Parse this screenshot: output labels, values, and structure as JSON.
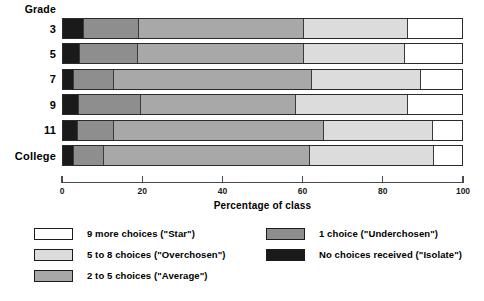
{
  "chart_data": {
    "type": "bar",
    "subtype": "stacked-horizontal-100",
    "title": "",
    "xlabel": "Percentage of class",
    "ylabel": "Grade",
    "xlim": [
      0,
      100
    ],
    "xticks": [
      0,
      20,
      40,
      60,
      80,
      100
    ],
    "xticklabels": [
      "0",
      "20",
      "40",
      "60",
      "80",
      "100"
    ],
    "grid": false,
    "legend_position": "bottom",
    "categories": [
      "3",
      "5",
      "7",
      "9",
      "11",
      "College"
    ],
    "series": [
      {
        "name": "No choices received (\"Isolate\")",
        "color": "#1a1a1a",
        "values": [
          5.2,
          4.3,
          2.7,
          4.1,
          3.8,
          2.8
        ]
      },
      {
        "name": "1 choice (\"Underchosen\")",
        "color": "#8e8e8e",
        "values": [
          13.8,
          14.4,
          10.1,
          15.4,
          8.9,
          7.5
        ]
      },
      {
        "name": "2 to 5 choices (\"Average\")",
        "color": "#a8a8a8",
        "values": [
          41.0,
          41.3,
          49.2,
          38.5,
          52.3,
          51.3
        ]
      },
      {
        "name": "5 to 8 choices (\"Overchosen\")",
        "color": "#dcdcdc",
        "values": [
          26.0,
          25.3,
          27.3,
          28.0,
          27.3,
          30.9
        ]
      },
      {
        "name": "9 more choices (\"Star\")",
        "color": "#ffffff",
        "values": [
          14.0,
          14.7,
          10.7,
          14.0,
          7.7,
          7.5
        ]
      }
    ]
  },
  "axis": {
    "category_header": "Grade",
    "value_title": "Percentage of class"
  },
  "legend": {
    "left_column": [
      {
        "label": "9 more choices (\"Star\")",
        "color": "#ffffff"
      },
      {
        "label": "5 to 8 choices (\"Overchosen\")",
        "color": "#dcdcdc"
      },
      {
        "label": "2 to 5 choices (\"Average\")",
        "color": "#a8a8a8"
      }
    ],
    "right_column": [
      {
        "label": "1 choice (\"Underchosen\")",
        "color": "#8e8e8e"
      },
      {
        "label": "No choices received (\"Isolate\")",
        "color": "#1a1a1a"
      }
    ]
  }
}
